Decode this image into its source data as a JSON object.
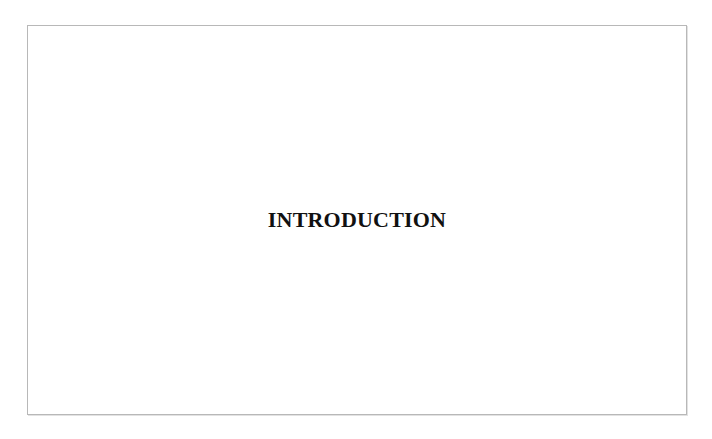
{
  "page": {
    "title": "INTRODUCTION"
  }
}
